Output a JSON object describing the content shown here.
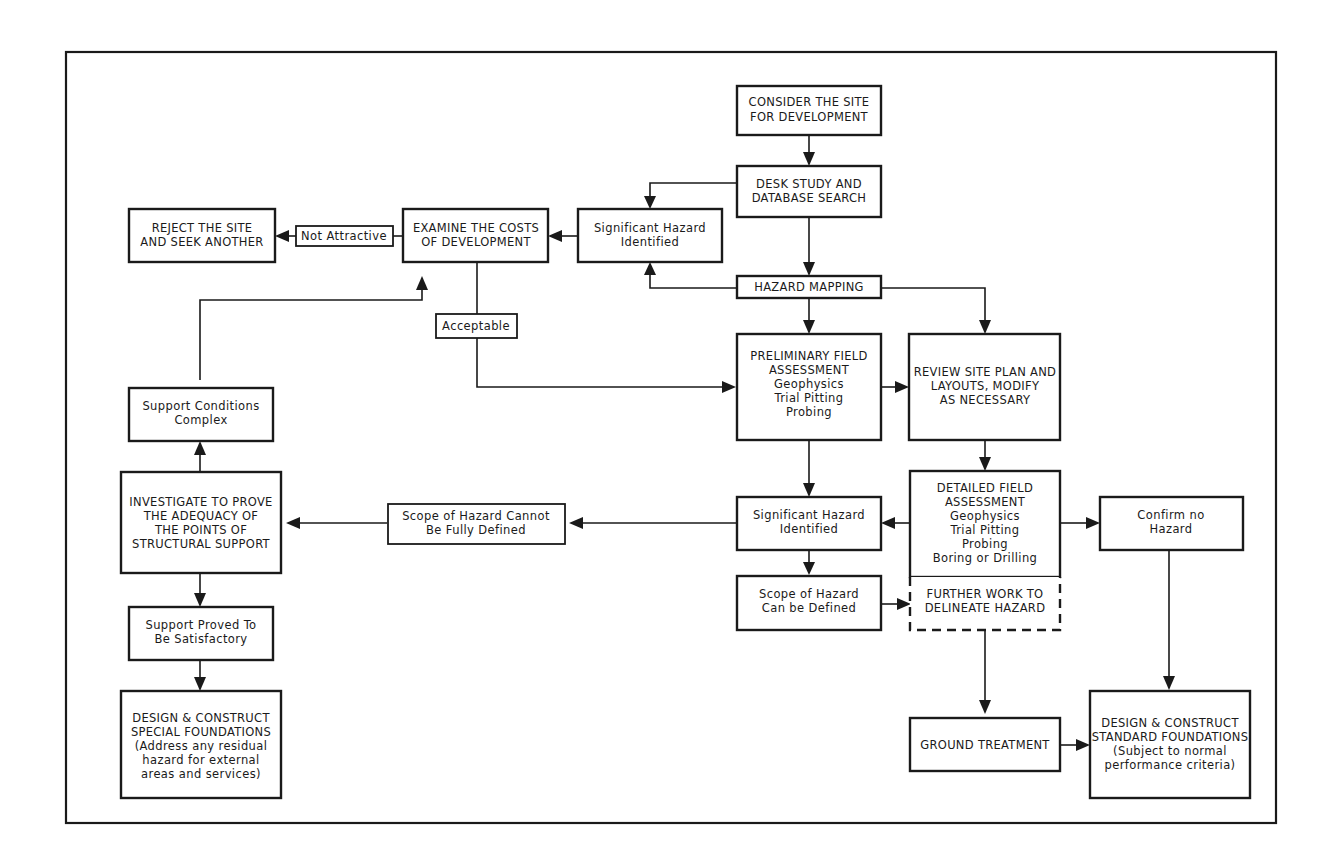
{
  "diagram": {
    "nodes": {
      "consider_site": {
        "lines": [
          "CONSIDER THE SITE",
          "FOR DEVELOPMENT"
        ]
      },
      "desk_study": {
        "lines": [
          "DESK STUDY AND",
          "DATABASE SEARCH"
        ]
      },
      "hazard_mapping": {
        "lines": [
          "HAZARD MAPPING"
        ]
      },
      "sig_hazard_top": {
        "lines": [
          "Significant Hazard",
          "Identified"
        ]
      },
      "examine_costs": {
        "lines": [
          "EXAMINE THE COSTS",
          "OF DEVELOPMENT"
        ]
      },
      "not_attractive": {
        "lines": [
          "Not Attractive"
        ]
      },
      "reject_site": {
        "lines": [
          "REJECT THE SITE",
          "AND SEEK ANOTHER"
        ]
      },
      "acceptable": {
        "lines": [
          "Acceptable"
        ]
      },
      "preliminary_field": {
        "lines": [
          "PRELIMINARY FIELD",
          "ASSESSMENT",
          "Geophysics",
          "Trial Pitting",
          "Probing"
        ]
      },
      "review_site_plan": {
        "lines": [
          "REVIEW SITE PLAN AND",
          "LAYOUTS, MODIFY",
          "AS NECESSARY"
        ]
      },
      "detailed_field": {
        "lines": [
          "DETAILED FIELD",
          "ASSESSMENT",
          "Geophysics",
          "Trial Pitting",
          "Probing",
          "Boring or Drilling"
        ]
      },
      "sig_hazard_mid": {
        "lines": [
          "Significant Hazard",
          "Identified"
        ]
      },
      "confirm_no_hazard": {
        "lines": [
          "Confirm no",
          "Hazard"
        ]
      },
      "scope_cannot": {
        "lines": [
          "Scope of Hazard Cannot",
          "Be Fully Defined"
        ]
      },
      "scope_can": {
        "lines": [
          "Scope of Hazard",
          "Can be Defined"
        ]
      },
      "further_work": {
        "lines": [
          "FURTHER WORK TO",
          "DELINEATE HAZARD"
        ]
      },
      "investigate": {
        "lines": [
          "INVESTIGATE TO PROVE",
          "THE ADEQUACY OF",
          "THE POINTS OF",
          "STRUCTURAL SUPPORT"
        ]
      },
      "support_complex": {
        "lines": [
          "Support Conditions",
          "Complex"
        ]
      },
      "support_proved": {
        "lines": [
          "Support Proved To",
          "Be Satisfactory"
        ]
      },
      "special_foundations": {
        "lines": [
          "DESIGN & CONSTRUCT",
          "SPECIAL FOUNDATIONS",
          "(Address any residual",
          "hazard for external",
          "areas and services)"
        ]
      },
      "ground_treatment": {
        "lines": [
          "GROUND TREATMENT"
        ]
      },
      "standard_foundations": {
        "lines": [
          "DESIGN & CONSTRUCT",
          "STANDARD FOUNDATIONS",
          "(Subject to normal",
          "performance criteria)"
        ]
      }
    },
    "colors": {
      "ink": "#1a1a1a",
      "background": "#ffffff"
    }
  }
}
